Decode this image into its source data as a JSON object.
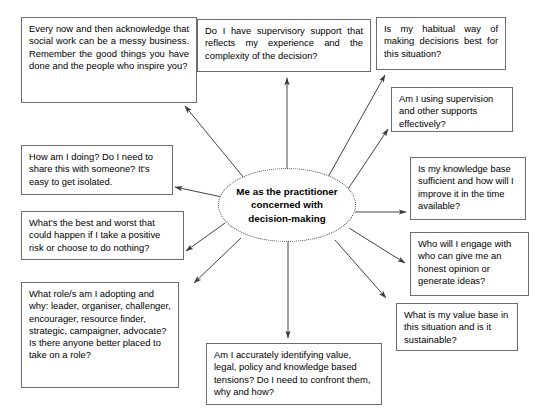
{
  "diagram": {
    "title": "Me as the practitioner concerned with decision-making",
    "type": "mind-map",
    "center": {
      "label": "Me as the practitioner concerned with decision-making",
      "shape": "ellipse",
      "border_style": "dotted",
      "border_color": "#4a4a4a",
      "text_color": "#000000",
      "bold": true
    },
    "style": {
      "background": "#ffffff",
      "box_border_color": "#6d6d6d",
      "box_fill": "#ffffff",
      "arrow_color": "#3a3a3a",
      "text_color": "#000000"
    },
    "nodes": [
      {
        "id": "acknowledge-messy-business",
        "text": "Every now and then acknowledge that social work can be a messy business. Remember the good things you have done and the people who inspire you?",
        "position": "top-left"
      },
      {
        "id": "supervisory-support",
        "text": "Do I have supervisory support that reflects my experience and the complexity of the decision?",
        "position": "top-center"
      },
      {
        "id": "habitual-way-of-deciding",
        "text": "Is my habitual way of making decisions best for this situation?",
        "position": "top-right"
      },
      {
        "id": "using-supervision-supports",
        "text": "Am I using supervision and other supports effectively?",
        "position": "upper-right"
      },
      {
        "id": "how-am-i-doing",
        "text": "How am I doing? Do I need to share this with someone? It's easy to get isolated.",
        "position": "left-upper"
      },
      {
        "id": "knowledge-base-sufficient",
        "text": "Is my knowledge base sufficient and how will I improve it in the time available?",
        "position": "right-middle"
      },
      {
        "id": "best-and-worst",
        "text": "What's the best and worst that could happen if I take a positive risk or choose to do nothing?",
        "position": "left-middle"
      },
      {
        "id": "who-will-i-engage",
        "text": "Who will I engage with who can give me an honest opinion or generate ideas?",
        "position": "right-lower"
      },
      {
        "id": "what-roles-am-i-adopting",
        "text": "What role/s am I adopting and why: leader, organiser, challenger, encourager, resource finder, strategic, campaigner, advocate? Is there anyone better placed to take on a role?",
        "position": "bottom-left"
      },
      {
        "id": "value-base-sustainable",
        "text": "What is my value base in this situation and is it sustainable?",
        "position": "bottom-right"
      },
      {
        "id": "identifying-tensions",
        "text": "Am I accurately identifying value, legal, policy and knowledge based tensions? Do I need to confront them, why and how?",
        "position": "bottom-center"
      }
    ],
    "edges": [
      {
        "from": "center",
        "to": "acknowledge-messy-business",
        "arrow": "to-node"
      },
      {
        "from": "center",
        "to": "supervisory-support",
        "arrow": "to-node"
      },
      {
        "from": "center",
        "to": "habitual-way-of-deciding",
        "arrow": "to-node"
      },
      {
        "from": "center",
        "to": "using-supervision-supports",
        "arrow": "to-node"
      },
      {
        "from": "center",
        "to": "how-am-i-doing",
        "arrow": "to-node"
      },
      {
        "from": "center",
        "to": "knowledge-base-sufficient",
        "arrow": "to-node"
      },
      {
        "from": "center",
        "to": "best-and-worst",
        "arrow": "to-node"
      },
      {
        "from": "center",
        "to": "who-will-i-engage",
        "arrow": "to-node"
      },
      {
        "from": "center",
        "to": "what-roles-am-i-adopting",
        "arrow": "to-node"
      },
      {
        "from": "center",
        "to": "value-base-sustainable",
        "arrow": "to-node"
      },
      {
        "from": "center",
        "to": "identifying-tensions",
        "arrow": "to-node"
      }
    ]
  }
}
